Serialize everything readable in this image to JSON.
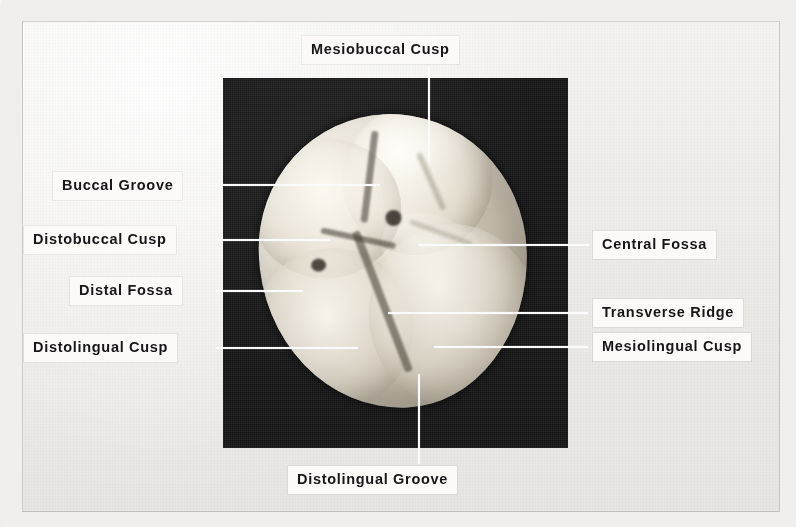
{
  "figure": {
    "kind": "annotated-photograph",
    "background_color": "#f0efed",
    "photo_background_color": "#131313",
    "label_background_color": "#fbfaf8",
    "label_text_color": "#17171a",
    "leader_line_color": "#fbfbfb"
  },
  "labels": [
    {
      "id": "mesiobuccal-cusp",
      "text": "Mesiobuccal Cusp",
      "side": "top"
    },
    {
      "id": "buccal-groove",
      "text": "Buccal Groove",
      "side": "left"
    },
    {
      "id": "distobuccal-cusp",
      "text": "Distobuccal Cusp",
      "side": "left"
    },
    {
      "id": "distal-fossa",
      "text": "Distal Fossa",
      "side": "left"
    },
    {
      "id": "distolingual-cusp",
      "text": "Distolingual Cusp",
      "side": "left"
    },
    {
      "id": "central-fossa",
      "text": "Central Fossa",
      "side": "right"
    },
    {
      "id": "transverse-ridge",
      "text": "Transverse Ridge",
      "side": "right"
    },
    {
      "id": "mesiolingual-cusp",
      "text": "Mesiolingual Cusp",
      "side": "right"
    },
    {
      "id": "distolingual-groove",
      "text": "Distolingual Groove",
      "side": "bottom"
    }
  ]
}
